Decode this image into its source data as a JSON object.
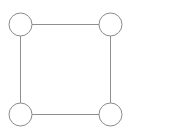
{
  "diagram": {
    "type": "undirected-graph",
    "background_color": "#ffffff",
    "canvas": {
      "width": 182,
      "height": 132
    },
    "style": {
      "node_stroke_color": "#8a8a8a",
      "node_fill_color": "#ffffff",
      "node_stroke_width": 1,
      "node_radius": 11.5,
      "edge_color": "#8f8f8f",
      "edge_width": 1
    },
    "nodes": [
      {
        "id": "n1",
        "label": "",
        "position": "top-left",
        "cx": 20.5,
        "cy": 24.5
      },
      {
        "id": "n2",
        "label": "",
        "position": "top-right",
        "cx": 110.5,
        "cy": 24.5
      },
      {
        "id": "n3",
        "label": "",
        "position": "bottom-left",
        "cx": 20.5,
        "cy": 114.5
      },
      {
        "id": "n4",
        "label": "",
        "position": "bottom-right",
        "cx": 110.5,
        "cy": 114.5
      }
    ],
    "edges": [
      {
        "id": "e1",
        "label": "",
        "from": "n1",
        "to": "n2",
        "x1": 32,
        "y1": 24.5,
        "x2": 99,
        "y2": 24.5
      },
      {
        "id": "e2",
        "label": "",
        "from": "n2",
        "to": "n4",
        "x1": 110.5,
        "y1": 36,
        "x2": 110.5,
        "y2": 103
      },
      {
        "id": "e3",
        "label": "",
        "from": "n4",
        "to": "n3",
        "x1": 99,
        "y1": 114.5,
        "x2": 32,
        "y2": 114.5
      },
      {
        "id": "e4",
        "label": "",
        "from": "n3",
        "to": "n1",
        "x1": 20.5,
        "y1": 103,
        "x2": 20.5,
        "y2": 36
      }
    ]
  }
}
